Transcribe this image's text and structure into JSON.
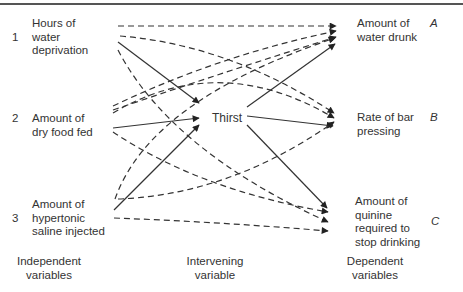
{
  "diagram": {
    "independent": [
      {
        "number": "1",
        "lines": [
          "Hours of",
          "water",
          "deprivation"
        ]
      },
      {
        "number": "2",
        "lines": [
          "Amount of",
          "dry food fed"
        ]
      },
      {
        "number": "3",
        "lines": [
          "Amount of",
          "hypertonic",
          "saline injected"
        ]
      }
    ],
    "intervening": {
      "label": "Thirst"
    },
    "dependent": [
      {
        "letter": "A",
        "lines": [
          "Amount of",
          "water drunk"
        ]
      },
      {
        "letter": "B",
        "lines": [
          "Rate of bar",
          "pressing"
        ]
      },
      {
        "letter": "C",
        "lines": [
          "Amount of",
          "quinine",
          "required to",
          "stop drinking"
        ]
      }
    ],
    "column_labels": {
      "independent": [
        "Independent",
        "variables"
      ],
      "intervening": [
        "Intervening",
        "variable"
      ],
      "dependent": [
        "Dependent",
        "variables"
      ]
    },
    "edges": {
      "solid": [
        "1->Thirst",
        "2->Thirst",
        "3->Thirst",
        "Thirst->A",
        "Thirst->B",
        "Thirst->C"
      ],
      "dashed": [
        "1->A",
        "1->B",
        "1->C",
        "2->A",
        "2->A",
        "2->B",
        "2->C",
        "3->A",
        "3->B",
        "3->C"
      ]
    },
    "colors": {
      "line": "#333333",
      "text": "#333333"
    }
  }
}
